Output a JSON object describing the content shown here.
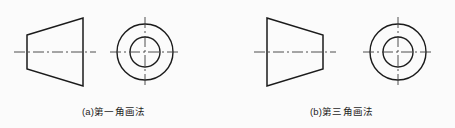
{
  "figure": {
    "background_color": "#fbfbfb",
    "line_color": "#1b1b1b",
    "centerline_color": "#3a3a3a",
    "panels": [
      {
        "id": "panel-a",
        "caption": "(a)第一角画法",
        "front_view": {
          "shape": "trapezoid",
          "orientation": "narrow-left-wide-right",
          "left_edge_height": 34,
          "right_edge_height": 68
        },
        "side_view": {
          "shape": "concentric-circles",
          "outer_diameter": 56,
          "inner_diameter": 30
        }
      },
      {
        "id": "panel-b",
        "caption": "(b)第三角画法",
        "front_view": {
          "shape": "trapezoid",
          "orientation": "wide-left-narrow-right",
          "left_edge_height": 68,
          "right_edge_height": 34
        },
        "side_view": {
          "shape": "concentric-circles",
          "outer_diameter": 56,
          "inner_diameter": 30
        }
      }
    ]
  }
}
